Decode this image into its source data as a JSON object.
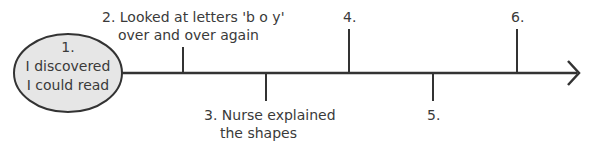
{
  "diagram": {
    "type": "timeline",
    "start_node": {
      "number": "1.",
      "line1": "I discovered",
      "line2": "I could read",
      "fill": "#e6e6e6",
      "stroke": "#333333"
    },
    "events": [
      {
        "number": "2.",
        "line1": "2. Looked at letters 'b o y'",
        "line2": "over and over again",
        "position": "above"
      },
      {
        "number": "3.",
        "line1": "3. Nurse explained",
        "line2": "the shapes",
        "position": "below"
      },
      {
        "number": "4.",
        "line1": "4.",
        "position": "above"
      },
      {
        "number": "5.",
        "line1": "5.",
        "position": "below"
      },
      {
        "number": "6.",
        "line1": "6.",
        "position": "above"
      }
    ],
    "line_color": "#333333"
  }
}
